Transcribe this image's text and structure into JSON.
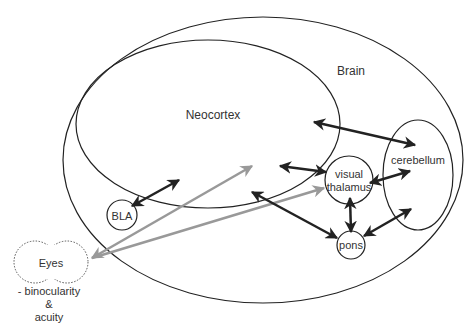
{
  "diagram": {
    "title": "",
    "regions": {
      "brain": "Brain",
      "neocortex": "Neocortex",
      "cerebellum": "cerebellum",
      "visual_thalamus_line1": "visual",
      "visual_thalamus_line2": "thalamus",
      "pons": "pons",
      "bla": "BLA",
      "eyes": "Eyes"
    },
    "eyes_note": {
      "line1": "- binocularity",
      "line2": "&",
      "line3": "acuity"
    },
    "colors": {
      "outline": "#222222",
      "dark_arrow": "#222222",
      "gray_arrow": "#999999",
      "text": "#333333"
    },
    "connections": [
      {
        "from": "Neocortex",
        "to": "cerebellum",
        "type": "bidirectional",
        "color": "dark"
      },
      {
        "from": "Neocortex",
        "to": "visual thalamus",
        "type": "bidirectional",
        "color": "dark"
      },
      {
        "from": "visual thalamus",
        "to": "cerebellum",
        "type": "bidirectional",
        "color": "dark"
      },
      {
        "from": "visual thalamus",
        "to": "pons",
        "type": "bidirectional",
        "color": "dark"
      },
      {
        "from": "pons",
        "to": "cerebellum",
        "type": "bidirectional",
        "color": "dark"
      },
      {
        "from": "Neocortex",
        "to": "pons",
        "type": "bidirectional",
        "color": "dark"
      },
      {
        "from": "BLA",
        "to": "Neocortex",
        "type": "bidirectional",
        "color": "dark"
      },
      {
        "from": "Eyes",
        "to": "Neocortex",
        "type": "bidirectional",
        "color": "gray"
      },
      {
        "from": "Eyes",
        "to": "visual thalamus",
        "type": "bidirectional",
        "color": "gray"
      }
    ]
  }
}
